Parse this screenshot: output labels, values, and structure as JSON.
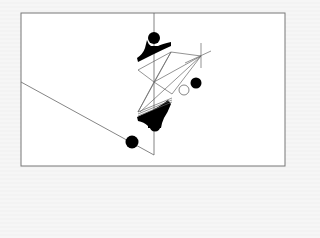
{
  "diagram": {
    "title": "",
    "colors": {
      "frame": "#777777",
      "line": "#666666",
      "fill": "#000000",
      "panel": "#ffffff"
    },
    "frame": {
      "x": 21,
      "y": 13,
      "w": 264,
      "h": 153
    },
    "elements": {
      "vertical_axis": {
        "x": 154,
        "y1": 13,
        "y2": 155
      },
      "diagonal_line": {
        "x1": 21,
        "y1": 82,
        "x2": 154,
        "y2": 155
      },
      "filled_circles": [
        {
          "cx": 154,
          "cy": 38,
          "r": 6
        },
        {
          "cx": 196,
          "cy": 83,
          "r": 5.5
        },
        {
          "cx": 155,
          "cy": 126,
          "r": 5.5
        },
        {
          "cx": 132,
          "cy": 142,
          "r": 6.5
        }
      ],
      "hollow_circle": {
        "cx": 184,
        "cy": 90,
        "r": 5
      }
    }
  }
}
